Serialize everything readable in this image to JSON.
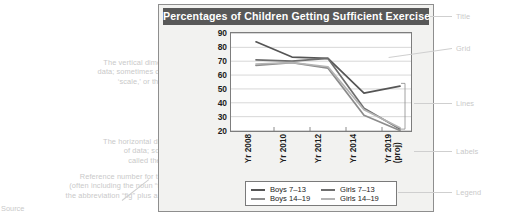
{
  "chart": {
    "title": "Percentages of Children Getting Sufficient Exercise"
  },
  "chart_data": {
    "type": "line",
    "title": "Percentages of Children Getting Sufficient Exercise",
    "xlabel": "",
    "ylabel": "",
    "categories": [
      "Yr 2008",
      "Yr 2010",
      "Yr 2012",
      "Yr 2014",
      "Yr 2019 (proj)"
    ],
    "ylim": [
      20,
      90
    ],
    "yticks": [
      20,
      30,
      40,
      50,
      60,
      70,
      80,
      90
    ],
    "grid": true,
    "legend_position": "bottom",
    "series": [
      {
        "name": "Boys 7–13",
        "color": "#555555",
        "values": [
          84,
          73,
          72,
          47,
          52
        ]
      },
      {
        "name": "Girls 7–13",
        "color": "#6e6e6e",
        "values": [
          71,
          70,
          72,
          36,
          21
        ]
      },
      {
        "name": "Boys 14–19",
        "color": "#8c8c8c",
        "values": [
          67,
          69,
          65,
          31,
          20
        ]
      },
      {
        "name": "Girls 14–19",
        "color": "#b4b4b4",
        "values": [
          68,
          69,
          66,
          35,
          22
        ]
      }
    ]
  },
  "annotations": {
    "right": [
      {
        "id": "title",
        "label": "Title"
      },
      {
        "id": "grid",
        "label": "Grid"
      },
      {
        "id": "lines",
        "label": "Lines"
      },
      {
        "id": "labels",
        "label": "Labels"
      },
      {
        "id": "legend",
        "label": "Legend"
      }
    ],
    "left": [
      {
        "id": "y-axis",
        "label": "The vertical dimension of\ndata; sometimes called the\n‘scale,’ or the ‘y-axis’"
      },
      {
        "id": "x-axis",
        "label": "The horizontal dimension\nof data; sometimes\ncalled the “x-axis”"
      },
      {
        "id": "figure-number",
        "label": "Reference number for the visual\n(often including the noun “figure” or\nthe abbreviation “fig” plus a number)"
      }
    ],
    "source": "Source"
  }
}
